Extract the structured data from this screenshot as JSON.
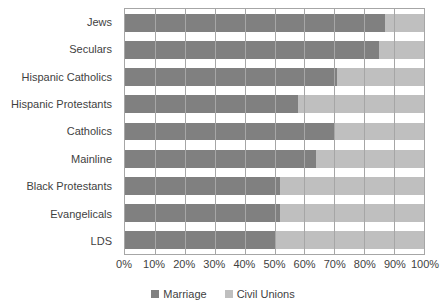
{
  "chart_data": {
    "type": "bar",
    "subtype": "horizontal-stacked-100",
    "title": "",
    "subtitle": "",
    "xlabel": "",
    "ylabel": "",
    "xlim": [
      0,
      100
    ],
    "grid": true,
    "legend_position": "bottom",
    "categories": [
      "Jews",
      "Seculars",
      "Hispanic Catholics",
      "Hispanic Protestants",
      "Catholics",
      "Mainline",
      "Black Protestants",
      "Evangelicals",
      "LDS"
    ],
    "series": [
      {
        "name": "Marriage",
        "color": "#808080",
        "values": [
          87,
          85,
          71,
          58,
          70,
          64,
          52,
          52,
          50
        ]
      },
      {
        "name": "Civil Unions",
        "color": "#bfbfbf",
        "values": [
          13,
          15,
          29,
          42,
          30,
          36,
          48,
          48,
          50
        ]
      }
    ],
    "x_ticks": [
      {
        "value": 0,
        "label": "0%"
      },
      {
        "value": 10,
        "label": "10%"
      },
      {
        "value": 20,
        "label": "20%"
      },
      {
        "value": 30,
        "label": "30%"
      },
      {
        "value": 40,
        "label": "40%"
      },
      {
        "value": 50,
        "label": "50%"
      },
      {
        "value": 60,
        "label": "60%"
      },
      {
        "value": 70,
        "label": "70%"
      },
      {
        "value": 80,
        "label": "80%"
      },
      {
        "value": 90,
        "label": "90%"
      },
      {
        "value": 100,
        "label": "100%"
      }
    ]
  },
  "colors": {
    "series_marriage": "#808080",
    "series_civil_unions": "#bfbfbf",
    "axis_line": "#a6a6a6",
    "grid_line": "#a6a6a6",
    "text": "#3f3f3f",
    "background": "#ffffff"
  }
}
